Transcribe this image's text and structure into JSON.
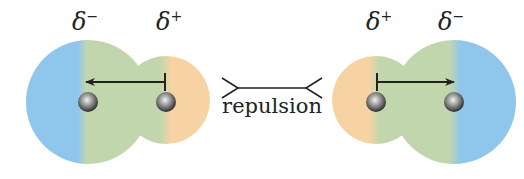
{
  "diagram": {
    "colors": {
      "negative": "#8ec6ec",
      "neutral": "#c2d6ad",
      "positive": "#f7d3a3",
      "atom_dark": "#3a3a3a",
      "atom_light": "#e0e0e0",
      "line": "#222222"
    },
    "left_molecule": {
      "label_negative": "δ",
      "label_negative_sign": "−",
      "label_positive": "δ",
      "label_positive_sign": "+",
      "dipole_direction": "right-to-left"
    },
    "right_molecule": {
      "label_positive": "δ",
      "label_positive_sign": "+",
      "label_negative": "δ",
      "label_negative_sign": "−",
      "dipole_direction": "left-to-right"
    },
    "interaction": {
      "label": "repulsion"
    }
  }
}
